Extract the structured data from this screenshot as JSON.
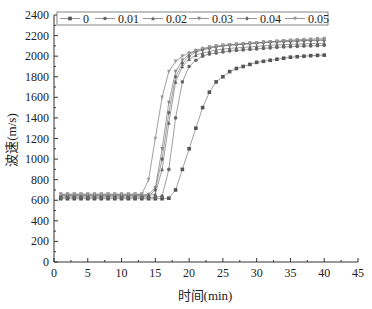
{
  "chart_data": {
    "type": "line",
    "title": "",
    "xlabel": "时间(min)",
    "ylabel": "波速(m/s)",
    "xlim": [
      0,
      45
    ],
    "ylim": [
      0,
      2400
    ],
    "xticks": [
      0,
      5,
      10,
      15,
      20,
      25,
      30,
      35,
      40,
      45
    ],
    "yticks": [
      0,
      200,
      400,
      600,
      800,
      1000,
      1200,
      1400,
      1600,
      1800,
      2000,
      2200,
      2400
    ],
    "grid": false,
    "legend_position": "top-inside",
    "x": [
      1,
      2,
      3,
      4,
      5,
      6,
      7,
      8,
      9,
      10,
      11,
      12,
      13,
      14,
      15,
      16,
      17,
      18,
      19,
      20,
      21,
      22,
      23,
      24,
      25,
      26,
      27,
      28,
      29,
      30,
      31,
      32,
      33,
      34,
      35,
      36,
      37,
      38,
      39,
      40
    ],
    "series": [
      {
        "name": "0",
        "marker": "square",
        "color": "#555555",
        "values": [
          615,
          615,
          615,
          615,
          615,
          615,
          615,
          615,
          615,
          615,
          615,
          615,
          615,
          615,
          615,
          615,
          620,
          700,
          900,
          1100,
          1300,
          1500,
          1650,
          1750,
          1800,
          1850,
          1880,
          1900,
          1920,
          1940,
          1950,
          1960,
          1970,
          1980,
          1990,
          1995,
          2000,
          2005,
          2008,
          2010
        ]
      },
      {
        "name": "0.01",
        "marker": "circle",
        "color": "#666666",
        "values": [
          630,
          630,
          630,
          630,
          630,
          630,
          630,
          630,
          630,
          630,
          630,
          630,
          630,
          630,
          630,
          640,
          900,
          1400,
          1750,
          1900,
          1960,
          2000,
          2020,
          2030,
          2040,
          2050,
          2055,
          2060,
          2065,
          2070,
          2075,
          2080,
          2085,
          2090,
          2092,
          2095,
          2098,
          2100,
          2102,
          2105
        ]
      },
      {
        "name": "0.02",
        "marker": "triangle-up",
        "color": "#666666",
        "values": [
          645,
          645,
          645,
          645,
          645,
          645,
          645,
          645,
          645,
          645,
          645,
          645,
          645,
          645,
          660,
          900,
          1350,
          1750,
          1900,
          1970,
          2010,
          2030,
          2045,
          2060,
          2070,
          2075,
          2080,
          2085,
          2090,
          2095,
          2100,
          2105,
          2110,
          2112,
          2115,
          2118,
          2120,
          2122,
          2124,
          2125
        ]
      },
      {
        "name": "0.03",
        "marker": "triangle-down",
        "color": "#888888",
        "values": [
          655,
          655,
          655,
          655,
          655,
          655,
          655,
          655,
          655,
          655,
          655,
          655,
          655,
          655,
          720,
          1100,
          1550,
          1850,
          1960,
          2020,
          2050,
          2070,
          2085,
          2095,
          2105,
          2110,
          2115,
          2120,
          2125,
          2130,
          2135,
          2140,
          2142,
          2145,
          2148,
          2150,
          2152,
          2154,
          2156,
          2158
        ]
      },
      {
        "name": "0.04",
        "marker": "diamond",
        "color": "#666666",
        "values": [
          640,
          640,
          640,
          640,
          640,
          640,
          640,
          640,
          640,
          640,
          640,
          640,
          640,
          640,
          700,
          1000,
          1450,
          1800,
          1930,
          2000,
          2040,
          2060,
          2075,
          2090,
          2100,
          2105,
          2110,
          2115,
          2120,
          2125,
          2130,
          2135,
          2138,
          2140,
          2142,
          2145,
          2148,
          2150,
          2152,
          2155
        ]
      },
      {
        "name": "0.05",
        "marker": "triangle-down",
        "color": "#999999",
        "values": [
          660,
          660,
          660,
          660,
          660,
          660,
          660,
          660,
          660,
          660,
          660,
          660,
          660,
          800,
          1200,
          1600,
          1850,
          1950,
          2000,
          2030,
          2055,
          2075,
          2085,
          2095,
          2100,
          2110,
          2115,
          2120,
          2125,
          2130,
          2135,
          2140,
          2145,
          2150,
          2155,
          2160,
          2162,
          2165,
          2168,
          2170
        ]
      }
    ]
  },
  "legend": {
    "items": [
      "0",
      "0.01",
      "0.02",
      "0.03",
      "0.04",
      "0.05"
    ]
  },
  "axes": {
    "xlabel": "时间(min)",
    "ylabel": "波速(m/s)"
  }
}
